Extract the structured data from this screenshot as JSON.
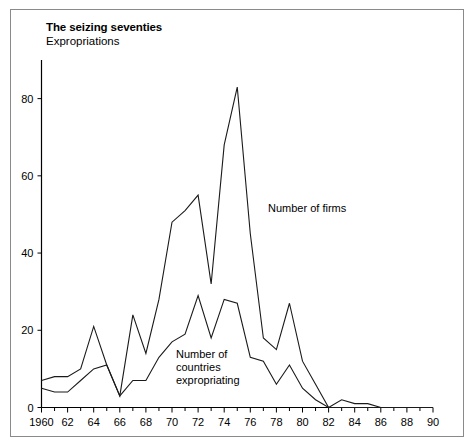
{
  "chart_data": {
    "type": "line",
    "title": "The seizing seventies",
    "subtitle": "Expropriations",
    "xlabel": "",
    "ylabel": "",
    "xlim": [
      1960,
      1990
    ],
    "ylim": [
      0,
      90
    ],
    "yticks": [
      0,
      20,
      40,
      60,
      80
    ],
    "ytick_labels": [
      "0",
      "20",
      "40",
      "60",
      "80"
    ],
    "xticks": [
      1960,
      1962,
      1964,
      1966,
      1968,
      1970,
      1972,
      1974,
      1976,
      1978,
      1980,
      1982,
      1984,
      1986,
      1988,
      1990
    ],
    "xtick_labels": [
      "1960",
      "62",
      "64",
      "66",
      "68",
      "70",
      "72",
      "74",
      "76",
      "78",
      "80",
      "82",
      "84",
      "86",
      "88",
      "90"
    ],
    "minor_tick_interval": 1,
    "grid": false,
    "legend_position": "inline-annotations",
    "x": [
      1960,
      1961,
      1962,
      1963,
      1964,
      1965,
      1966,
      1967,
      1968,
      1969,
      1970,
      1971,
      1972,
      1973,
      1974,
      1975,
      1976,
      1977,
      1978,
      1979,
      1980,
      1981,
      1982,
      1983,
      1984,
      1985,
      1986,
      1987,
      1988,
      1989,
      1990
    ],
    "series": [
      {
        "name": "Number of firms",
        "values": [
          7,
          8,
          8,
          10,
          21,
          11,
          3,
          24,
          14,
          28,
          48,
          51,
          55,
          32,
          68,
          83,
          45,
          18,
          15,
          27,
          12,
          6,
          0,
          2,
          1,
          1,
          0,
          0,
          0,
          0,
          0
        ]
      },
      {
        "name": "Number of countries expropriating",
        "values": [
          5,
          4,
          4,
          7,
          10,
          11,
          3,
          7,
          7,
          13,
          17,
          19,
          29,
          18,
          28,
          27,
          13,
          12,
          6,
          11,
          5,
          2,
          0,
          0,
          0,
          0,
          0,
          0,
          0,
          0,
          0
        ]
      }
    ],
    "annotations": [
      {
        "text": "Number of firms",
        "series": "Number of firms"
      },
      {
        "text": "Number of countries expropriating",
        "series": "Number of countries expropriating"
      }
    ]
  },
  "annotation_lines": {
    "countries_line1": "Number of",
    "countries_line2": "countries",
    "countries_line3": "expropriating",
    "firms_label": "Number of firms"
  },
  "colors": {
    "background": "#ffffff",
    "border": "#8a8a8a",
    "axis": "#000000",
    "line": "#1a1a1a",
    "text": "#000000"
  }
}
